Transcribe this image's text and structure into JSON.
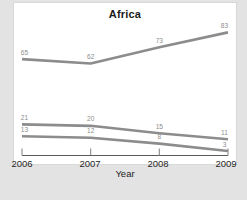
{
  "chart_data": {
    "type": "line",
    "title": "Africa",
    "xlabel": "Year",
    "ylabel": "",
    "categories": [
      "2006",
      "2007",
      "2008",
      "2009"
    ],
    "x": [
      2006,
      2007,
      2008,
      2009
    ],
    "xlim": [
      2006,
      2009
    ],
    "ylim": [
      0,
      90
    ],
    "grid": false,
    "legend": "none",
    "series": [
      {
        "name": "series-1",
        "values": [
          65,
          62,
          73,
          83
        ],
        "color": "#8c8c8c"
      },
      {
        "name": "series-2",
        "values": [
          21,
          20,
          15,
          11
        ],
        "color": "#8c8c8c"
      },
      {
        "name": "series-3",
        "values": [
          13,
          12,
          8,
          3
        ],
        "color": "#8c8c8c"
      }
    ],
    "data_labels": {
      "series-1": [
        "65",
        "62",
        "73",
        "83"
      ],
      "series-2": [
        "21",
        "20",
        "15",
        "11"
      ],
      "series-3": [
        "13",
        "12",
        "8",
        "3"
      ]
    }
  },
  "axis": {
    "ticks": [
      "2006",
      "2007",
      "2008",
      "2009"
    ],
    "title": "Year"
  }
}
